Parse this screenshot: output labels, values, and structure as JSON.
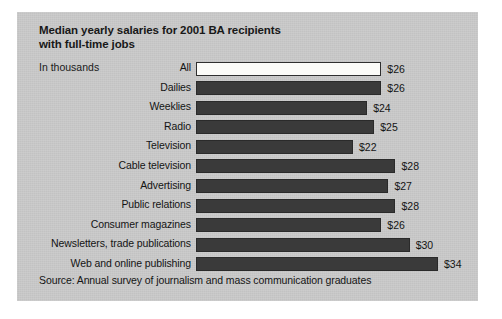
{
  "chart_data": {
    "type": "bar",
    "orientation": "horizontal",
    "title": "Median yearly salaries for 2001 BA recipients\nwith full-time jobs",
    "units_label": "In thousands",
    "source": "Source: Annual survey of journalism and mass communication graduates",
    "xlabel": "",
    "ylabel": "",
    "grid": false,
    "legend": "none",
    "axis_visible": false,
    "value_prefix": "$",
    "xlim": [
      0,
      34
    ],
    "categories": [
      "All",
      "Dailies",
      "Weeklies",
      "Radio",
      "Television",
      "Cable television",
      "Advertising",
      "Public relations",
      "Consumer magazines",
      "Newsletters, trade publications",
      "Web and online publishing"
    ],
    "values": [
      26,
      26,
      24,
      25,
      22,
      28,
      27,
      28,
      26,
      30,
      34
    ],
    "value_labels": [
      "$26",
      "$26",
      "$24",
      "$25",
      "$22",
      "$28",
      "$27",
      "$28",
      "$26",
      "$30",
      "$34"
    ],
    "bar_styles": [
      "light",
      "dark",
      "dark",
      "dark",
      "dark",
      "dark",
      "dark",
      "dark",
      "dark",
      "dark",
      "dark"
    ],
    "colors": {
      "panel_background": "#c9c9c9",
      "bar_dark": "#3a3a3a",
      "bar_light": "#fbfbf8",
      "bar_outline": "#2a2a2a",
      "text": "#141414",
      "page_background": "#ffffff"
    }
  }
}
